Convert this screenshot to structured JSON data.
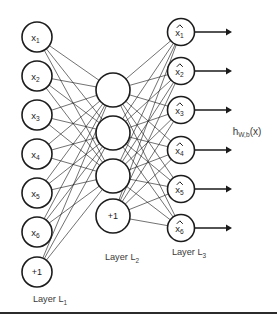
{
  "figure": {
    "kind": "neural-network-diagram",
    "background_color": "#ffffff",
    "ink_color": "#1c1c1c",
    "label_color": "#3a3a3a",
    "width": 277,
    "height": 321
  },
  "layers": [
    {
      "id": "input",
      "label_base": "Layer L",
      "label_sub": "1",
      "label_x": 50,
      "label_y": 300,
      "node_radius": 15,
      "center_x": 37,
      "nodes": [
        {
          "name": "input-node-x1",
          "base": "x",
          "sub": "1",
          "kind": "unit",
          "cy": 37
        },
        {
          "name": "input-node-x2",
          "base": "x",
          "sub": "2",
          "kind": "unit",
          "cy": 76
        },
        {
          "name": "input-node-x3",
          "base": "x",
          "sub": "3",
          "kind": "unit",
          "cy": 115
        },
        {
          "name": "input-node-x4",
          "base": "x",
          "sub": "4",
          "kind": "unit",
          "cy": 154
        },
        {
          "name": "input-node-x5",
          "base": "x",
          "sub": "5",
          "kind": "unit",
          "cy": 193
        },
        {
          "name": "input-node-x6",
          "base": "x",
          "sub": "6",
          "kind": "unit",
          "cy": 232
        },
        {
          "name": "input-bias-node",
          "base": "+1",
          "sub": "",
          "kind": "bias",
          "cy": 272
        }
      ]
    },
    {
      "id": "hidden",
      "label_base": "Layer L",
      "label_sub": "2",
      "label_x": 122,
      "label_y": 258,
      "node_radius": 17,
      "center_x": 113,
      "nodes": [
        {
          "name": "hidden-node-1",
          "base": "",
          "sub": "",
          "kind": "unit",
          "cy": 90
        },
        {
          "name": "hidden-node-2",
          "base": "",
          "sub": "",
          "kind": "unit",
          "cy": 133
        },
        {
          "name": "hidden-node-3",
          "base": "",
          "sub": "",
          "kind": "unit",
          "cy": 176
        },
        {
          "name": "hidden-bias-node",
          "base": "+1",
          "sub": "",
          "kind": "bias",
          "cy": 216
        }
      ]
    },
    {
      "id": "output",
      "label_base": "Layer L",
      "label_sub": "3",
      "label_x": 189,
      "label_y": 253,
      "node_radius": 13.5,
      "center_x": 181,
      "nodes": [
        {
          "name": "output-node-xhat1",
          "base": "x",
          "sub": "1",
          "kind": "hat",
          "cy": 32
        },
        {
          "name": "output-node-xhat2",
          "base": "x",
          "sub": "2",
          "kind": "hat",
          "cy": 71
        },
        {
          "name": "output-node-xhat3",
          "base": "x",
          "sub": "3",
          "kind": "hat",
          "cy": 110
        },
        {
          "name": "output-node-xhat4",
          "base": "x",
          "sub": "4",
          "kind": "hat",
          "cy": 150
        },
        {
          "name": "output-node-xhat5",
          "base": "x",
          "sub": "5",
          "kind": "hat",
          "cy": 189
        },
        {
          "name": "output-node-xhat6",
          "base": "x",
          "sub": "6",
          "kind": "hat",
          "cy": 228
        }
      ]
    }
  ],
  "output_arrows": {
    "name": "output-arrow",
    "start_offset": 14,
    "end_x": 232
  },
  "hypothesis": {
    "base": "h",
    "sub": "W,b",
    "tail": "(x)",
    "x": 247,
    "y": 132
  },
  "bottom_rule": {
    "name": "bottom-border-rule",
    "y": 313,
    "x1": 0,
    "x2": 277
  }
}
